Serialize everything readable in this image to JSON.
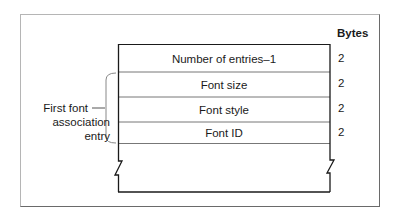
{
  "diagram": {
    "column_header": "Bytes",
    "rows": [
      {
        "label": "Number of entries–1",
        "bytes": "2"
      },
      {
        "label": "Font size",
        "bytes": "2"
      },
      {
        "label": "Font style",
        "bytes": "2"
      },
      {
        "label": "Font ID",
        "bytes": "2"
      }
    ],
    "group_label": {
      "line1": "First font",
      "line2": "association",
      "line3": "entry"
    }
  }
}
